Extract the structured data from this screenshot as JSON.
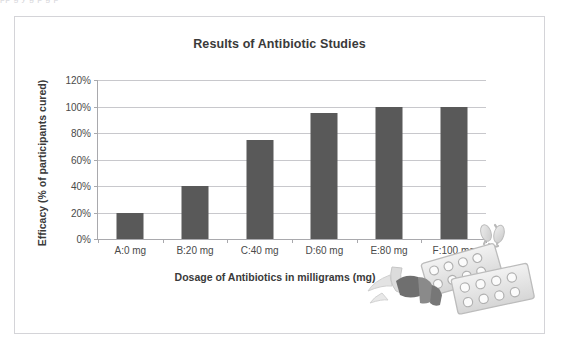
{
  "top_sliver_text": "pp    g y            g p           g p",
  "chart": {
    "title": "Results of Antibiotic Studies",
    "x_axis_title": "Dosage of Antibiotics in milligrams (mg)",
    "y_axis_title": "Efficacy (% of participants cured)",
    "bar_color": "#595959",
    "gridline_color": "#c8c8cc",
    "axis_color": "#a9a9ad",
    "border_color": "#d4d4d8",
    "background": "#ffffff"
  },
  "decoration": {
    "photo_name": "pills-and-blister-packs-photo",
    "description": "grayscale photo of capsules and two blister packs of tablets"
  },
  "chart_data": {
    "type": "bar",
    "title": "Results of Antibiotic Studies",
    "xlabel": "Dosage of Antibiotics in milligrams (mg)",
    "ylabel": "Efficacy (% of participants cured)",
    "categories": [
      "A:0 mg",
      "B:20 mg",
      "C:40 mg",
      "D:60 mg",
      "E:80 mg",
      "F:100 mg"
    ],
    "values": [
      20,
      40,
      75,
      95,
      100,
      100
    ],
    "value_unit": "%",
    "ylim": [
      0,
      120
    ],
    "ytick_values": [
      0,
      20,
      40,
      60,
      80,
      100,
      120
    ],
    "ytick_labels": [
      "0%",
      "20%",
      "40%",
      "60%",
      "80%",
      "100%",
      "120%"
    ],
    "grid": true,
    "grid_axis": "y",
    "legend": false,
    "series": [
      {
        "name": "Efficacy",
        "values": [
          20,
          40,
          75,
          95,
          100,
          100
        ]
      }
    ]
  }
}
